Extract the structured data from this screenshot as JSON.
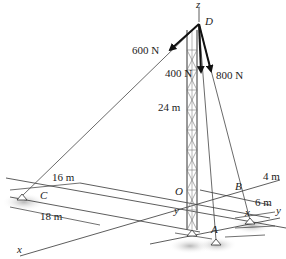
{
  "diagram": {
    "points": {
      "D": "D",
      "O": "O",
      "A": "A",
      "B": "B",
      "C": "C"
    },
    "axes": {
      "x": "x",
      "y": "y",
      "z": "z"
    },
    "forces": [
      {
        "label": "600 N",
        "to": "C"
      },
      {
        "label": "400 N",
        "to": "A"
      },
      {
        "label": "800 N",
        "to": "B"
      }
    ],
    "dimensions": {
      "tower_height": "24 m",
      "c_y": "16 m",
      "c_x": "18 m",
      "b_x": "4 m",
      "b_y": "6 m",
      "a_y": "y",
      "a_x": "x"
    },
    "colors": {
      "ink": "#222222",
      "shadow": "#bfbfbf",
      "tower": "#666666"
    }
  }
}
